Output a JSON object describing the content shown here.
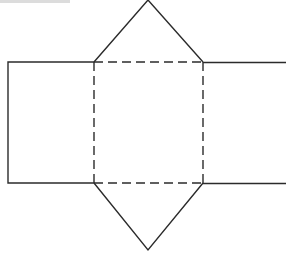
{
  "diagram": {
    "type": "triangular-prism-net",
    "stroke_color": "#2b2b2b",
    "solid_stroke_width": 1.4,
    "dashed_stroke_width": 1.4,
    "dash_pattern": "9 5",
    "faces": {
      "left_rectangle": {
        "x1": 8,
        "y1": 62,
        "x2": 94,
        "y2": 183
      },
      "center_square": {
        "x1": 94,
        "y1": 62,
        "x2": 203,
        "y2": 183
      },
      "right_rectangle": {
        "x1": 203,
        "y1": 62,
        "x2": 286,
        "y2": 183
      },
      "top_triangle": {
        "apex": [
          148,
          0
        ],
        "base_left": [
          94,
          62
        ],
        "base_right": [
          203,
          62
        ]
      },
      "bottom_triangle": {
        "apex": [
          148,
          250
        ],
        "base_left": [
          94,
          183
        ],
        "base_right": [
          203,
          183
        ]
      }
    },
    "fold_lines": "dashed",
    "cut_lines": "solid"
  }
}
